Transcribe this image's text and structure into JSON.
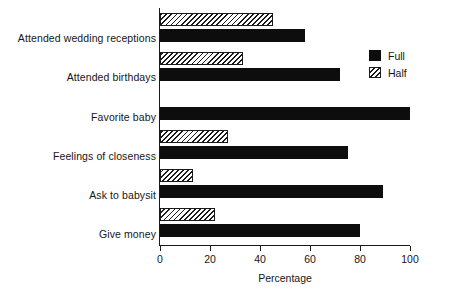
{
  "chart_data": {
    "type": "bar",
    "orientation": "horizontal",
    "title": "",
    "xlabel": "Percentage",
    "ylabel": "",
    "xlim": [
      0,
      100
    ],
    "xticks": [
      0,
      20,
      40,
      60,
      80,
      100
    ],
    "xtick_labels": [
      "0",
      "20",
      "40",
      "60",
      "80",
      "100"
    ],
    "grid": false,
    "legend_position": "top-right",
    "categories": [
      "Attended wedding receptions",
      "Attended birthdays",
      "Favorite baby",
      "Feelings of closeness",
      "Ask to babysit",
      "Give money"
    ],
    "series": [
      {
        "name": "Full",
        "style": "solid-black",
        "color": "#0d0d0d",
        "values": [
          58,
          72,
          100,
          75,
          89,
          80
        ]
      },
      {
        "name": "Half",
        "style": "hatched",
        "color": "#ffffff",
        "values": [
          45,
          33,
          0,
          27,
          13,
          22
        ]
      }
    ]
  },
  "legend": {
    "items": [
      {
        "label": "Full",
        "swatch": "solid-black-swatch"
      },
      {
        "label": "Half",
        "swatch": "hatched-swatch"
      }
    ]
  },
  "axis": {
    "x_title": "Percentage",
    "ticks": [
      "0",
      "20",
      "40",
      "60",
      "80",
      "100"
    ]
  },
  "colors": {
    "ink": "#1a1a1a",
    "full_fill": "#0d0d0d",
    "half_fill": "#ffffff",
    "background": "#ffffff"
  }
}
